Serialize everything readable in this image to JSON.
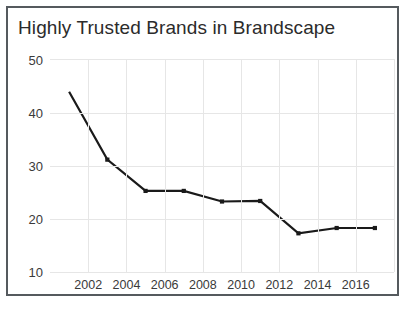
{
  "chart_data": {
    "type": "line",
    "title": "Highly Trusted Brands in Brandscape",
    "xlabel": "",
    "ylabel": "",
    "x": [
      2001,
      2003,
      2005,
      2007,
      2009,
      2011,
      2013,
      2015,
      2017
    ],
    "values": [
      44.0,
      31.2,
      25.3,
      25.3,
      23.3,
      23.4,
      17.3,
      18.3,
      18.3
    ],
    "series": [
      {
        "name": "Highly Trusted Brands",
        "values": [
          44.0,
          31.2,
          25.3,
          25.3,
          23.3,
          23.4,
          17.3,
          18.3,
          18.3
        ]
      }
    ],
    "xlim": [
      2000,
      2018
    ],
    "ylim": [
      10,
      50
    ],
    "ytick_labels": [
      "10",
      "20",
      "30",
      "40",
      "50"
    ],
    "ytick_values": [
      10,
      20,
      30,
      40,
      50
    ],
    "xtick_labels": [
      "2002",
      "2004",
      "2006",
      "2008",
      "2010",
      "2012",
      "2014",
      "2016"
    ],
    "xtick_values": [
      2002,
      2004,
      2006,
      2008,
      2010,
      2012,
      2014,
      2016
    ],
    "grid": true,
    "legend": "none",
    "line_color": "#1a1a1a",
    "marker_color": "#1a1a1a",
    "grid_color": "#e6e6e6",
    "border_color": "#555a5e",
    "text_color": "#2b2b2b"
  }
}
